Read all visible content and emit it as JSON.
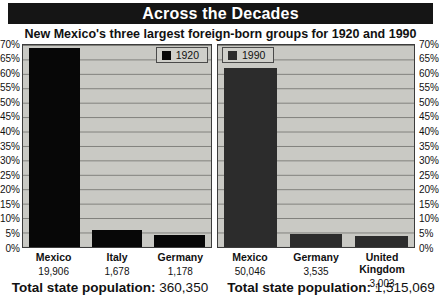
{
  "title": "Across the Decades",
  "subtitle": "New Mexico's three largest foreign-born groups for 1920 and 1990",
  "colors": {
    "banner_bg": "#151515",
    "banner_text": "#ffffff",
    "plot_bg": "#c9c9c4",
    "grid": "#7e7e7a",
    "bar_1920": "#070707",
    "bar_1990": "#2c2c2c"
  },
  "axis": {
    "max": 70,
    "ticks": [
      "70%",
      "65%",
      "60%",
      "55%",
      "50%",
      "45%",
      "40%",
      "35%",
      "30%",
      "25%",
      "20%",
      "15%",
      "10%",
      "5%",
      "0%"
    ]
  },
  "chart_data": [
    {
      "type": "bar",
      "legend": "1920",
      "categories": [
        "Mexico",
        "Italy",
        "Germany"
      ],
      "counts": [
        "19,906",
        "1,678",
        "1,178"
      ],
      "values_pct": [
        69,
        5.8,
        4.1
      ],
      "ylabel": "percent of foreign-born population",
      "ylim": [
        0,
        70
      ],
      "grid": true,
      "legend_position": "top-right",
      "total_label": "Total state population:",
      "total_value": "360,350"
    },
    {
      "type": "bar",
      "legend": "1990",
      "categories": [
        "Mexico",
        "Germany",
        "United Kingdom"
      ],
      "counts": [
        "50,046",
        "3,535",
        "3,003"
      ],
      "values_pct": [
        62,
        4.4,
        3.7
      ],
      "ylabel": "percent of foreign-born population",
      "ylim": [
        0,
        70
      ],
      "grid": true,
      "legend_position": "top-left",
      "total_label": "Total state population:",
      "total_value": "1,515,069"
    }
  ]
}
